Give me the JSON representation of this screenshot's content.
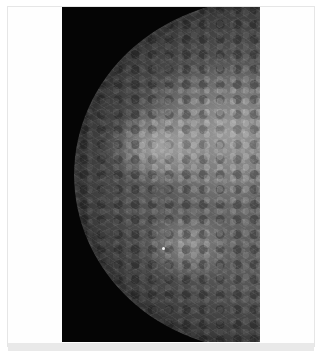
{
  "image": {
    "subject": "mammogram",
    "description": "Craniocaudal-style breast radiograph on black background within a white frame",
    "colors": {
      "frame": "#ffffff",
      "frame_border": "#e6e6e6",
      "panel_background": "#050505",
      "tissue_mid": "#6e6e6e",
      "bottom_strip": "#e9e9e9"
    }
  }
}
